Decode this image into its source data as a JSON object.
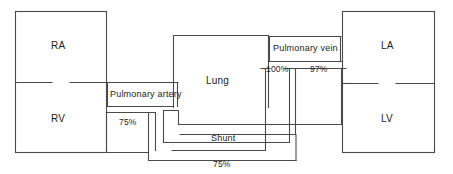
{
  "diagram": {
    "type": "flow-diagram",
    "stroke_color": "#4a4a4a",
    "text_color": "#1c1c1c",
    "background_color": "#ffffff",
    "chambers": [
      {
        "id": "ra",
        "label": "RA",
        "name": "right-atrium"
      },
      {
        "id": "rv",
        "label": "RV",
        "name": "right-ventricle"
      },
      {
        "id": "la",
        "label": "LA",
        "name": "left-atrium"
      },
      {
        "id": "lv",
        "label": "LV",
        "name": "left-ventricle"
      }
    ],
    "organs": [
      {
        "id": "lung",
        "label": "Lung",
        "name": "lung-box"
      }
    ],
    "vessels": [
      {
        "id": "pa",
        "label": "Pulmonary artery",
        "name": "pulmonary-artery"
      },
      {
        "id": "pv",
        "label": "Pulmonary vein",
        "name": "pulmonary-vein"
      },
      {
        "id": "shunt",
        "label": "Shunt",
        "name": "shunt-channel"
      }
    ],
    "saturations": [
      {
        "id": "sat_pa",
        "label": "75%",
        "name": "saturation-pulmonary-artery"
      },
      {
        "id": "sat_pv",
        "label": "100%",
        "name": "saturation-pulmonary-vein"
      },
      {
        "id": "sat_la",
        "label": "97%",
        "name": "saturation-left-atrium"
      },
      {
        "id": "sat_shunt",
        "label": "75%",
        "name": "saturation-shunt-return"
      }
    ]
  }
}
